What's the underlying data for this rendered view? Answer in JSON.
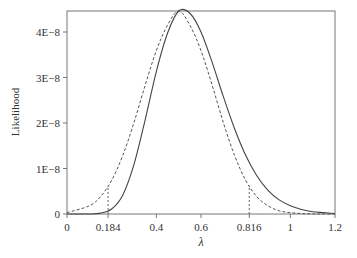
{
  "chart_data": {
    "type": "line",
    "title": "",
    "xlabel": "λ",
    "ylabel": "Likelihood",
    "xlim": [
      0,
      1.2
    ],
    "ylim": [
      0,
      4.46e-08
    ],
    "grid": false,
    "legend": null,
    "x_ticks": [
      {
        "value": 0,
        "label": "0"
      },
      {
        "value": 0.184,
        "label": "0.184"
      },
      {
        "value": 0.4,
        "label": "0.4"
      },
      {
        "value": 0.6,
        "label": "0.6"
      },
      {
        "value": 0.816,
        "label": "0.816"
      },
      {
        "value": 1,
        "label": "1"
      },
      {
        "value": 1.2,
        "label": "1.2"
      }
    ],
    "y_ticks": [
      {
        "value": 0,
        "label": "0"
      },
      {
        "value": 1e-08,
        "label": "1E−8"
      },
      {
        "value": 2e-08,
        "label": "2E−8"
      },
      {
        "value": 3e-08,
        "label": "3E−8"
      },
      {
        "value": 4e-08,
        "label": "4E−8"
      }
    ],
    "reference_lines": [
      {
        "x": 0.184,
        "style": "dotted",
        "description": "lower bound"
      },
      {
        "x": 0.816,
        "style": "dotted",
        "description": "upper bound"
      }
    ],
    "series": [
      {
        "name": "Exact likelihood",
        "style": "solid",
        "x": [
          0,
          0.1,
          0.15,
          0.2,
          0.25,
          0.3,
          0.35,
          0.4,
          0.45,
          0.5,
          0.55,
          0.6,
          0.65,
          0.7,
          0.75,
          0.8,
          0.85,
          0.9,
          0.95,
          1.0,
          1.05,
          1.1,
          1.15,
          1.2
        ],
        "values": [
          0,
          0.0,
          2e-10,
          1.1e-09,
          4.2e-09,
          1.09e-08,
          2.07e-08,
          3.13e-08,
          3.97e-08,
          4.46e-08,
          4.41e-08,
          4e-08,
          3.33e-08,
          2.58e-08,
          1.88e-08,
          1.29e-08,
          8.4e-09,
          5.2e-09,
          3.1e-09,
          1.8e-09,
          1e-09,
          5e-10,
          3e-10,
          1e-10
        ]
      },
      {
        "name": "Normal approximation",
        "style": "dashed",
        "x": [
          0,
          0.1,
          0.15,
          0.2,
          0.25,
          0.3,
          0.35,
          0.4,
          0.45,
          0.5,
          0.55,
          0.6,
          0.65,
          0.7,
          0.75,
          0.8,
          0.85,
          0.9,
          0.95,
          1.0,
          1.05,
          1.1,
          1.15,
          1.2
        ],
        "values": [
          3e-10,
          1.8e-09,
          3.8e-09,
          7.4e-09,
          1.29e-08,
          2.01e-08,
          2.83e-08,
          3.59e-08,
          4.15e-08,
          4.46e-08,
          4.15e-08,
          3.59e-08,
          2.83e-08,
          2.01e-08,
          1.29e-08,
          7.4e-09,
          3.8e-09,
          1.8e-09,
          7e-10,
          3e-10,
          1e-10,
          0.0,
          0.0,
          0.0
        ]
      }
    ]
  }
}
